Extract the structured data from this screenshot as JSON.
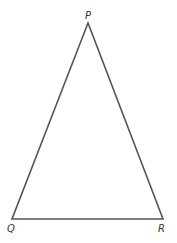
{
  "diagram": {
    "type": "triangle",
    "stroke_color": "#555555",
    "vertices": [
      {
        "label": "P",
        "x": 88,
        "y": 23
      },
      {
        "label": "Q",
        "x": 12,
        "y": 219
      },
      {
        "label": "R",
        "x": 163,
        "y": 219
      }
    ],
    "edges": [
      [
        "P",
        "Q"
      ],
      [
        "Q",
        "R"
      ],
      [
        "R",
        "P"
      ]
    ]
  }
}
